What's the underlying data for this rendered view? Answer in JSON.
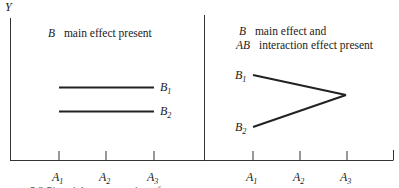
{
  "axis": {
    "y_label": "Y"
  },
  "panels": [
    {
      "title_lines": [
        {
          "factor": "B",
          "text": "main effect present"
        }
      ],
      "x_ticks": [
        {
          "main": "A",
          "sub": "1"
        },
        {
          "main": "A",
          "sub": "2"
        },
        {
          "main": "A",
          "sub": "3"
        }
      ],
      "series": [
        {
          "main": "B",
          "sub": "1"
        },
        {
          "main": "B",
          "sub": "2"
        }
      ]
    },
    {
      "title_lines": [
        {
          "factor": "B",
          "text": "main effect and"
        },
        {
          "factor": "AB",
          "text": "interaction effect present"
        }
      ],
      "x_ticks": [
        {
          "main": "A",
          "sub": "1"
        },
        {
          "main": "A",
          "sub": "2"
        },
        {
          "main": "A",
          "sub": "3"
        }
      ],
      "series": [
        {
          "main": "B",
          "sub": "1"
        },
        {
          "main": "B",
          "sub": "2"
        }
      ]
    }
  ],
  "caption": "5.2  Pictorial representation of"
}
